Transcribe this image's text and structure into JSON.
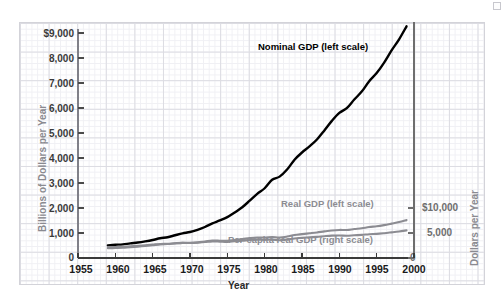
{
  "chart_data": {
    "type": "line",
    "title": "",
    "xlabel": "Year",
    "ylabel_left": "Billions of Dollars per Year",
    "ylabel_right": "Dollars per Year",
    "xlim": [
      1955,
      2000
    ],
    "ylim_left": [
      0,
      9000
    ],
    "ylim_right": [
      0,
      10000
    ],
    "grid": true,
    "legend_position": "inline-annotations",
    "xticks": [
      "1955",
      "1960",
      "1965",
      "1970",
      "1975",
      "1980",
      "1985",
      "1990",
      "1995",
      "2000"
    ],
    "xtick_values": [
      1955,
      1960,
      1965,
      1970,
      1975,
      1980,
      1985,
      1990,
      1995,
      2000
    ],
    "yticks_left": [
      "0",
      "1,000",
      "2,000",
      "3,000",
      "4,000",
      "5,000",
      "6,000",
      "7,000",
      "8,000",
      "$9,000"
    ],
    "ytick_values_left": [
      0,
      1000,
      2000,
      3000,
      4000,
      5000,
      6000,
      7000,
      8000,
      9000
    ],
    "yticks_right": [
      "0",
      "5,000",
      "$10,000"
    ],
    "ytick_values_right": [
      0,
      5000,
      10000
    ],
    "x": [
      1959,
      1960,
      1961,
      1962,
      1963,
      1964,
      1965,
      1966,
      1967,
      1968,
      1969,
      1970,
      1971,
      1972,
      1973,
      1974,
      1975,
      1976,
      1977,
      1978,
      1979,
      1980,
      1981,
      1982,
      1983,
      1984,
      1985,
      1986,
      1987,
      1988,
      1989,
      1990,
      1991,
      1992,
      1993,
      1994,
      1995,
      1996,
      1997,
      1998,
      1999
    ],
    "series": [
      {
        "name": "Nominal GDP (left scale)",
        "scale": "left",
        "color": "#000000",
        "unit": "Billions of Dollars per Year",
        "values": [
          506,
          527,
          545,
          586,
          618,
          664,
          720,
          788,
          832,
          910,
          985,
          1039,
          1128,
          1240,
          1385,
          1501,
          1635,
          1824,
          2030,
          2294,
          2563,
          2790,
          3128,
          3255,
          3537,
          3933,
          4220,
          4463,
          4740,
          5104,
          5484,
          5803,
          5996,
          6338,
          6657,
          7072,
          7398,
          7817,
          8304,
          8747,
          9268
        ]
      },
      {
        "name": "Real GDP (left scale)",
        "scale": "left",
        "color": "#8c8c92",
        "unit": "Billions of Dollars per Year",
        "values": [
          390,
          400,
          410,
          435,
          455,
          480,
          512,
          545,
          560,
          585,
          605,
          605,
          625,
          660,
          697,
          693,
          685,
          722,
          755,
          796,
          821,
          818,
          838,
          820,
          857,
          918,
          955,
          988,
          1022,
          1065,
          1103,
          1123,
          1120,
          1158,
          1190,
          1239,
          1268,
          1316,
          1375,
          1437,
          1515
        ]
      },
      {
        "name": "Per-capita real GDP (right scale)",
        "scale": "right",
        "color": "#8c8c92",
        "unit": "Dollars per Year",
        "values": [
          2180,
          2215,
          2240,
          2360,
          2430,
          2530,
          2670,
          2810,
          2855,
          2950,
          3020,
          2985,
          3050,
          3190,
          3330,
          3275,
          3205,
          3345,
          3460,
          3610,
          3680,
          3630,
          3680,
          3565,
          3690,
          3910,
          4030,
          4130,
          4230,
          4360,
          4470,
          4500,
          4440,
          4540,
          4620,
          4760,
          4825,
          4960,
          5130,
          5310,
          5530
        ]
      }
    ],
    "annotations": [
      {
        "text": "Nominal GDP (left scale)",
        "series": "Nominal GDP (left scale)"
      },
      {
        "text": "Real GDP (left scale)",
        "series": "Real GDP (left scale)"
      },
      {
        "text": "Per-capita real GDP (right scale)",
        "series": "Per-capita real GDP (right scale)"
      }
    ]
  },
  "axes": {
    "xlabel": "Year",
    "ylabel_left": "Billions of Dollars per Year",
    "ylabel_right": "Dollars per Year",
    "xticks": [
      "1955",
      "1960",
      "1965",
      "1970",
      "1975",
      "1980",
      "1985",
      "1990",
      "1995",
      "2000"
    ],
    "yticks_left": [
      "$9,000",
      "8,000",
      "7,000",
      "6,000",
      "5,000",
      "4,000",
      "3,000",
      "2,000",
      "1,000",
      "0"
    ],
    "yticks_right": [
      "$10,000",
      "5,000",
      "0"
    ]
  },
  "labels": {
    "nominal": "Nominal GDP (left scale)",
    "real": "Real GDP (left scale)",
    "percapita": "Per-capita real GDP (right scale)"
  },
  "colors": {
    "nominal": "#000000",
    "real": "#8c8c92",
    "percapita": "#8c8c92",
    "grid_major": "#dcdce2",
    "grid_minor": "#f0f0f4",
    "axis": "#808088",
    "background": "#ffffff"
  }
}
